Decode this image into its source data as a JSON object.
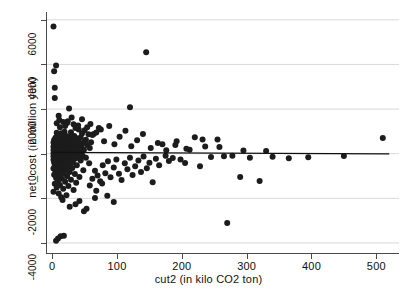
{
  "chart_data": {
    "type": "scatter",
    "title": "",
    "xlabel": "cut2  (in kilo CO2 ton)",
    "ylabel": "net_cost  (in million yen)",
    "xlim": [
      -8,
      535
    ],
    "ylim": [
      -4450,
      6350
    ],
    "xticks": [
      0,
      100,
      200,
      300,
      400,
      500
    ],
    "xtick_labels": [
      "0",
      "100",
      "200",
      "300",
      "400",
      "500"
    ],
    "yticks": [
      -4000,
      -2000,
      0,
      2000,
      4000,
      6000
    ],
    "ytick_labels": [
      "-4000",
      "-2000",
      "0",
      "2000",
      "4000",
      "6000"
    ],
    "grid": true,
    "grid_axis": "y",
    "grid_color": "#d9d9d9",
    "legend": false,
    "marker_color": "#1c1c1c",
    "marker_size": 3.0,
    "marker_shape": "circle",
    "fit_line": {
      "label": "linear fit",
      "color": "#111111",
      "width": 1.4,
      "x0": 0,
      "y0": 60,
      "x1": 520,
      "y1": -10
    },
    "points": [
      [
        2,
        5700
      ],
      [
        6,
        3950
      ],
      [
        3,
        3700
      ],
      [
        4,
        2950
      ],
      [
        4,
        2500
      ],
      [
        145,
        4550
      ],
      [
        26,
        2020
      ],
      [
        10,
        1700
      ],
      [
        17,
        1420
      ],
      [
        23,
        1380
      ],
      [
        33,
        1320
      ],
      [
        12,
        1180
      ],
      [
        36,
        1150
      ],
      [
        41,
        1080
      ],
      [
        50,
        1050
      ],
      [
        19,
        980
      ],
      [
        29,
        960
      ],
      [
        7,
        940
      ],
      [
        14,
        920
      ],
      [
        46,
        900
      ],
      [
        56,
        870
      ],
      [
        62,
        840
      ],
      [
        8,
        820
      ],
      [
        21,
        800
      ],
      [
        34,
        790
      ],
      [
        9,
        770
      ],
      [
        27,
        760
      ],
      [
        15,
        740
      ],
      [
        44,
        730
      ],
      [
        5,
        720
      ],
      [
        11,
        700
      ],
      [
        510,
        700
      ],
      [
        38,
        690
      ],
      [
        18,
        680
      ],
      [
        24,
        660
      ],
      [
        6,
        650
      ],
      [
        13,
        640
      ],
      [
        31,
        630
      ],
      [
        52,
        620
      ],
      [
        3,
        610
      ],
      [
        20,
        600
      ],
      [
        9,
        590
      ],
      [
        16,
        580
      ],
      [
        28,
        570
      ],
      [
        40,
        560
      ],
      [
        4,
        550
      ],
      [
        12,
        545
      ],
      [
        22,
        540
      ],
      [
        7,
        530
      ],
      [
        35,
        520
      ],
      [
        60,
        515
      ],
      [
        2,
        505
      ],
      [
        17,
        500
      ],
      [
        26,
        495
      ],
      [
        48,
        490
      ],
      [
        10,
        480
      ],
      [
        5,
        475
      ],
      [
        14,
        470
      ],
      [
        30,
        465
      ],
      [
        23,
        455
      ],
      [
        8,
        450
      ],
      [
        19,
        445
      ],
      [
        42,
        440
      ],
      [
        11,
        430
      ],
      [
        3,
        425
      ],
      [
        25,
        420
      ],
      [
        36,
        415
      ],
      [
        6,
        405
      ],
      [
        15,
        400
      ],
      [
        21,
        395
      ],
      [
        54,
        390
      ],
      [
        9,
        380
      ],
      [
        13,
        375
      ],
      [
        32,
        370
      ],
      [
        4,
        360
      ],
      [
        18,
        355
      ],
      [
        27,
        350
      ],
      [
        45,
        345
      ],
      [
        7,
        335
      ],
      [
        12,
        330
      ],
      [
        22,
        325
      ],
      [
        38,
        320
      ],
      [
        2,
        315
      ],
      [
        16,
        310
      ],
      [
        29,
        305
      ],
      [
        10,
        295
      ],
      [
        5,
        290
      ],
      [
        20,
        285
      ],
      [
        34,
        280
      ],
      [
        8,
        275
      ],
      [
        14,
        270
      ],
      [
        24,
        265
      ],
      [
        58,
        260
      ],
      [
        3,
        255
      ],
      [
        17,
        250
      ],
      [
        31,
        245
      ],
      [
        11,
        240
      ],
      [
        6,
        235
      ],
      [
        21,
        230
      ],
      [
        41,
        225
      ],
      [
        9,
        220
      ],
      [
        15,
        215
      ],
      [
        26,
        210
      ],
      [
        4,
        205
      ],
      [
        12,
        200
      ],
      [
        19,
        195
      ],
      [
        36,
        190
      ],
      [
        7,
        185
      ],
      [
        23,
        180
      ],
      [
        49,
        175
      ],
      [
        2,
        170
      ],
      [
        13,
        165
      ],
      [
        28,
        160
      ],
      [
        10,
        155
      ],
      [
        17,
        150
      ],
      [
        33,
        145
      ],
      [
        5,
        140
      ],
      [
        20,
        135
      ],
      [
        8,
        130
      ],
      [
        25,
        125
      ],
      [
        44,
        120
      ],
      [
        3,
        115
      ],
      [
        14,
        110
      ],
      [
        30,
        105
      ],
      [
        11,
        100
      ],
      [
        18,
        95
      ],
      [
        6,
        90
      ],
      [
        22,
        85
      ],
      [
        39,
        80
      ],
      [
        9,
        75
      ],
      [
        16,
        70
      ],
      [
        27,
        65
      ],
      [
        4,
        60
      ],
      [
        12,
        55
      ],
      [
        21,
        50
      ],
      [
        35,
        45
      ],
      [
        7,
        40
      ],
      [
        15,
        35
      ],
      [
        24,
        30
      ],
      [
        2,
        25
      ],
      [
        10,
        20
      ],
      [
        19,
        15
      ],
      [
        31,
        10
      ],
      [
        5,
        5
      ],
      [
        13,
        0
      ],
      [
        23,
        -5
      ],
      [
        42,
        -10
      ],
      [
        8,
        -15
      ],
      [
        17,
        -20
      ],
      [
        28,
        -25
      ],
      [
        3,
        -30
      ],
      [
        11,
        -35
      ],
      [
        20,
        -40
      ],
      [
        37,
        -45
      ],
      [
        6,
        -50
      ],
      [
        14,
        -55
      ],
      [
        26,
        -60
      ],
      [
        9,
        -65
      ],
      [
        18,
        -70
      ],
      [
        33,
        -75
      ],
      [
        4,
        -80
      ],
      [
        12,
        -85
      ],
      [
        22,
        -90
      ],
      [
        47,
        -95
      ],
      [
        7,
        -100
      ],
      [
        16,
        -105
      ],
      [
        29,
        -110
      ],
      [
        2,
        -115
      ],
      [
        10,
        -120
      ],
      [
        19,
        -125
      ],
      [
        40,
        -130
      ],
      [
        5,
        -135
      ],
      [
        13,
        -140
      ],
      [
        25,
        -145
      ],
      [
        8,
        -150
      ],
      [
        17,
        -155
      ],
      [
        34,
        -160
      ],
      [
        3,
        -165
      ],
      [
        11,
        -170
      ],
      [
        21,
        -175
      ],
      [
        52,
        -180
      ],
      [
        6,
        -185
      ],
      [
        15,
        -190
      ],
      [
        27,
        -195
      ],
      [
        9,
        -200
      ],
      [
        18,
        -205
      ],
      [
        36,
        -210
      ],
      [
        4,
        -215
      ],
      [
        12,
        -220
      ],
      [
        23,
        -230
      ],
      [
        7,
        -240
      ],
      [
        16,
        -250
      ],
      [
        30,
        -260
      ],
      [
        2,
        -270
      ],
      [
        10,
        -280
      ],
      [
        20,
        -290
      ],
      [
        44,
        -300
      ],
      [
        5,
        -310
      ],
      [
        13,
        -320
      ],
      [
        26,
        -330
      ],
      [
        8,
        -345
      ],
      [
        17,
        -360
      ],
      [
        32,
        -375
      ],
      [
        3,
        -390
      ],
      [
        11,
        -405
      ],
      [
        22,
        -420
      ],
      [
        57,
        -430
      ],
      [
        6,
        -445
      ],
      [
        14,
        -460
      ],
      [
        28,
        -475
      ],
      [
        9,
        -490
      ],
      [
        19,
        -505
      ],
      [
        38,
        -520
      ],
      [
        4,
        -540
      ],
      [
        12,
        -560
      ],
      [
        24,
        -580
      ],
      [
        7,
        -600
      ],
      [
        16,
        -620
      ],
      [
        31,
        -640
      ],
      [
        2,
        -665
      ],
      [
        10,
        -690
      ],
      [
        21,
        -715
      ],
      [
        48,
        -740
      ],
      [
        5,
        -765
      ],
      [
        13,
        -790
      ],
      [
        27,
        -815
      ],
      [
        8,
        -845
      ],
      [
        18,
        -875
      ],
      [
        35,
        -905
      ],
      [
        3,
        -940
      ],
      [
        11,
        -975
      ],
      [
        23,
        -1010
      ],
      [
        42,
        -1045
      ],
      [
        6,
        -1085
      ],
      [
        15,
        -1125
      ],
      [
        29,
        -1165
      ],
      [
        9,
        -1210
      ],
      [
        20,
        -1255
      ],
      [
        37,
        -1300
      ],
      [
        4,
        -1350
      ],
      [
        12,
        -1400
      ],
      [
        25,
        -1450
      ],
      [
        7,
        -1510
      ],
      [
        17,
        -1570
      ],
      [
        33,
        -1630
      ],
      [
        2,
        -1700
      ],
      [
        10,
        -1780
      ],
      [
        22,
        -1860
      ],
      [
        14,
        -1950
      ],
      [
        62,
        -1120
      ],
      [
        70,
        -980
      ],
      [
        66,
        -760
      ],
      [
        74,
        -1230
      ],
      [
        78,
        -520
      ],
      [
        82,
        -880
      ],
      [
        86,
        -340
      ],
      [
        90,
        -1060
      ],
      [
        95,
        -620
      ],
      [
        99,
        -260
      ],
      [
        103,
        -900
      ],
      [
        107,
        -1180
      ],
      [
        112,
        -430
      ],
      [
        116,
        -700
      ],
      [
        120,
        -180
      ],
      [
        124,
        -950
      ],
      [
        128,
        -560
      ],
      [
        133,
        -300
      ],
      [
        137,
        -820
      ],
      [
        141,
        -120
      ],
      [
        146,
        -650
      ],
      [
        150,
        -400
      ],
      [
        155,
        -1280
      ],
      [
        160,
        -230
      ],
      [
        165,
        -520
      ],
      [
        170,
        420
      ],
      [
        175,
        -90
      ],
      [
        180,
        -330
      ],
      [
        186,
        -190
      ],
      [
        192,
        560
      ],
      [
        198,
        -260
      ],
      [
        205,
        -420
      ],
      [
        212,
        180
      ],
      [
        220,
        740
      ],
      [
        228,
        -560
      ],
      [
        236,
        320
      ],
      [
        245,
        -150
      ],
      [
        255,
        640
      ],
      [
        265,
        -110
      ],
      [
        270,
        -3100
      ],
      [
        278,
        -90
      ],
      [
        290,
        -1040
      ],
      [
        305,
        -180
      ],
      [
        320,
        -1220
      ],
      [
        340,
        -140
      ],
      [
        365,
        -200
      ],
      [
        395,
        -160
      ],
      [
        450,
        -100
      ],
      [
        64,
        880
      ],
      [
        72,
        1150
      ],
      [
        80,
        560
      ],
      [
        88,
        1240
      ],
      [
        96,
        420
      ],
      [
        104,
        760
      ],
      [
        113,
        1030
      ],
      [
        122,
        330
      ],
      [
        131,
        600
      ],
      [
        140,
        880
      ],
      [
        152,
        260
      ],
      [
        163,
        480
      ],
      [
        176,
        160
      ],
      [
        190,
        390
      ],
      [
        207,
        220
      ],
      [
        232,
        640
      ],
      [
        258,
        300
      ],
      [
        295,
        140
      ],
      [
        330,
        120
      ],
      [
        120,
        2080
      ],
      [
        16,
        -2080
      ],
      [
        42,
        -2120
      ],
      [
        49,
        -2580
      ],
      [
        53,
        -2470
      ],
      [
        6,
        -3900
      ],
      [
        9,
        -3800
      ],
      [
        13,
        -3700
      ],
      [
        18,
        -3680
      ],
      [
        95,
        -2160
      ],
      [
        66,
        -1980
      ],
      [
        36,
        -2260
      ],
      [
        27,
        -2380
      ],
      [
        58,
        -1420
      ],
      [
        68,
        -1660
      ],
      [
        77,
        -1340
      ],
      [
        85,
        -1880
      ],
      [
        46,
        1540
      ],
      [
        59,
        1330
      ],
      [
        75,
        1090
      ],
      [
        30,
        1620
      ],
      [
        24,
        1450
      ],
      [
        40,
        1260
      ],
      [
        54,
        1190
      ],
      [
        68,
        950
      ],
      [
        7,
        1360
      ],
      [
        11,
        1510
      ],
      [
        20,
        1240
      ]
    ]
  }
}
